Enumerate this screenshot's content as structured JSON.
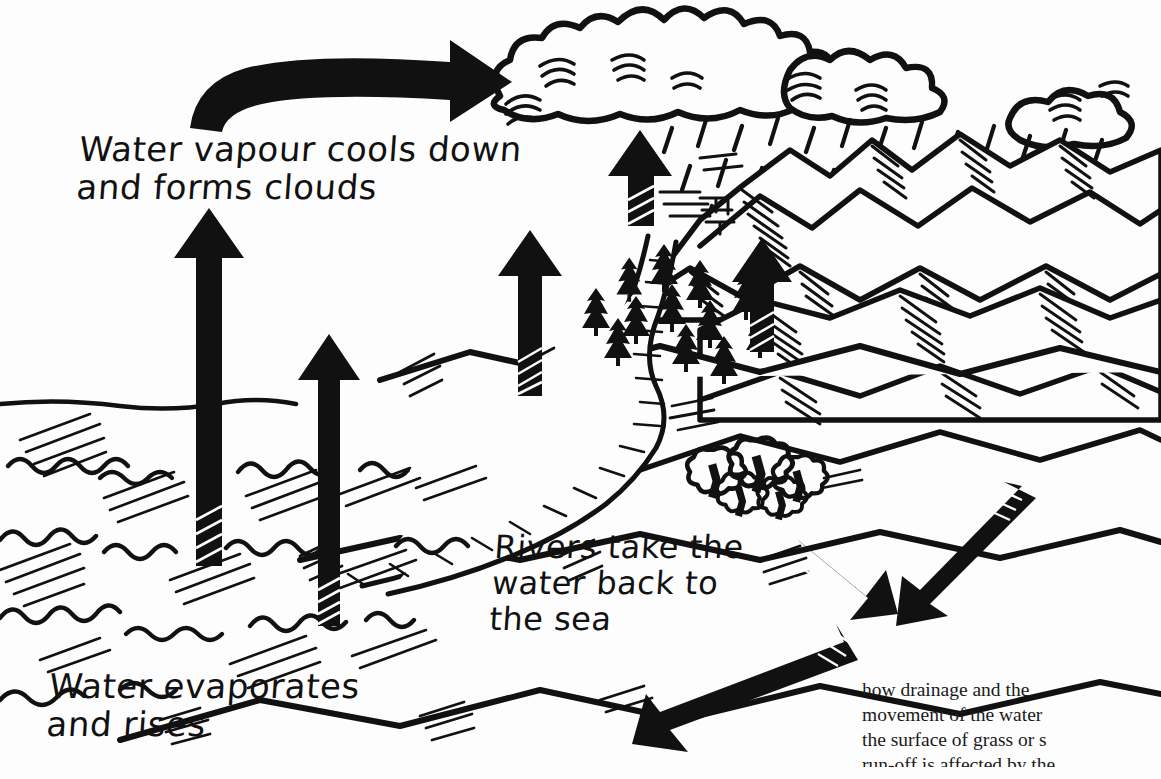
{
  "figure": {
    "background_color": "#fdfdfd",
    "ink_color": "#111111"
  },
  "labels": {
    "vapour": "Water vapour cools down\nand forms clouds",
    "rivers": "Rivers take the\n  water back to\n  the sea",
    "evaporation": "Water evaporates\nand rises"
  },
  "caption": {
    "line1": "how drainage and the",
    "line2": "movement of the water",
    "line3": "the surface of grass or s",
    "line4": "run-off is affected by the"
  },
  "scene": {
    "elements": [
      {
        "name": "sea",
        "description": "hatched sea with wave squiggles, lower left"
      },
      {
        "name": "clouds",
        "description": "row of cumulus clouds across the top"
      },
      {
        "name": "rain",
        "description": "dashes falling from clouds onto mountains"
      },
      {
        "name": "mountains",
        "description": "hatched mountain range, upper right"
      },
      {
        "name": "hills",
        "description": "rolling hatched hills, right"
      },
      {
        "name": "pine-forest",
        "description": "conifer trees on hillside, centre"
      },
      {
        "name": "deciduous-trees",
        "description": "cluster of broadleaf trees, lower right"
      },
      {
        "name": "river",
        "description": "winding river flowing from hills to sea"
      },
      {
        "name": "coastline",
        "description": "shoreline separating sea and land"
      }
    ],
    "arrows": [
      {
        "name": "evaporation-arrow-1",
        "direction": "up",
        "meaning": "water evaporates from the sea"
      },
      {
        "name": "evaporation-arrow-2",
        "direction": "up",
        "meaning": "water evaporates from the sea"
      },
      {
        "name": "evaporation-arrow-3",
        "direction": "up",
        "meaning": "water evaporates from the land"
      },
      {
        "name": "evaporation-arrow-4",
        "direction": "up",
        "meaning": "water evaporates from the forest"
      },
      {
        "name": "evaporation-arrow-5",
        "direction": "up",
        "meaning": "water evaporates from the hills"
      },
      {
        "name": "vapour-curve-arrow",
        "direction": "curve-right",
        "meaning": "vapour drifts and cools into cloud"
      },
      {
        "name": "drainage-arrow-up-left",
        "direction": "up-left",
        "meaning": "water moves back across the land"
      },
      {
        "name": "drainage-arrow-down-right",
        "direction": "down-right",
        "meaning": "water drains down the slope"
      },
      {
        "name": "drainage-arrow-down-left",
        "direction": "down-left",
        "meaning": "water runs off towards the sea"
      }
    ]
  }
}
